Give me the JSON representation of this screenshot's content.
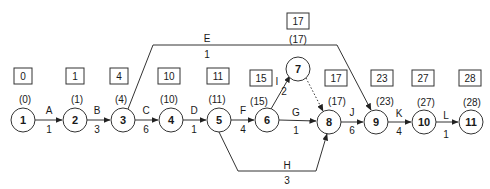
{
  "diagram": {
    "type": "activity-on-arrow network",
    "nodes": [
      {
        "id": "1",
        "x": 23,
        "y": 120,
        "early_start_box": "0",
        "early_start_paren": "(0)"
      },
      {
        "id": "2",
        "x": 75,
        "y": 120,
        "early_start_box": "1",
        "early_start_paren": "(1)"
      },
      {
        "id": "3",
        "x": 123,
        "y": 120,
        "early_start_box": "4",
        "early_start_paren": "(4)"
      },
      {
        "id": "4",
        "x": 171,
        "y": 120,
        "early_start_box": "10",
        "early_start_paren": "(10)"
      },
      {
        "id": "5",
        "x": 219,
        "y": 120,
        "early_start_box": "11",
        "early_start_paren": "(11)"
      },
      {
        "id": "6",
        "x": 267,
        "y": 120,
        "early_start_box": "15",
        "early_start_paren": "(15)"
      },
      {
        "id": "7",
        "x": 298,
        "y": 69,
        "early_start_box": "17",
        "early_start_paren": "(17)"
      },
      {
        "id": "8",
        "x": 329,
        "y": 122,
        "early_start_box": "17",
        "early_start_paren": "(17)"
      },
      {
        "id": "9",
        "x": 376,
        "y": 122,
        "early_start_box": "23",
        "early_start_paren": "(23)"
      },
      {
        "id": "10",
        "x": 424,
        "y": 122,
        "early_start_box": "27",
        "early_start_paren": "(27)"
      },
      {
        "id": "11",
        "x": 471,
        "y": 122,
        "early_start_box": "28",
        "early_start_paren": "(28)"
      }
    ],
    "edges": [
      {
        "activity": "A",
        "duration": "1",
        "from": "1",
        "to": "2"
      },
      {
        "activity": "B",
        "duration": "3",
        "from": "2",
        "to": "3"
      },
      {
        "activity": "C",
        "duration": "6",
        "from": "3",
        "to": "4"
      },
      {
        "activity": "D",
        "duration": "1",
        "from": "4",
        "to": "5"
      },
      {
        "activity": "E",
        "duration": "1",
        "from": "3",
        "to": "9"
      },
      {
        "activity": "F",
        "duration": "4",
        "from": "5",
        "to": "6"
      },
      {
        "activity": "G",
        "duration": "1",
        "from": "6",
        "to": "8"
      },
      {
        "activity": "H",
        "duration": "3",
        "from": "5",
        "to": "8"
      },
      {
        "activity": "I",
        "duration": "2",
        "from": "6",
        "to": "7"
      },
      {
        "activity": "",
        "duration": "",
        "from": "7",
        "to": "8",
        "dummy": true
      },
      {
        "activity": "J",
        "duration": "6",
        "from": "8",
        "to": "9"
      },
      {
        "activity": "K",
        "duration": "4",
        "from": "9",
        "to": "10"
      },
      {
        "activity": "L",
        "duration": "1",
        "from": "10",
        "to": "11"
      }
    ]
  },
  "labels": {
    "n1": "1",
    "n2": "2",
    "n3": "3",
    "n4": "4",
    "n5": "5",
    "n6": "6",
    "n7": "7",
    "n8": "8",
    "n9": "9",
    "n10": "10",
    "n11": "11",
    "b1": "0",
    "b2": "1",
    "b3": "4",
    "b4": "10",
    "b5": "11",
    "b6": "15",
    "b7": "17",
    "b8": "17",
    "b9": "23",
    "b10": "27",
    "b11": "28",
    "p1": "(0)",
    "p2": "(1)",
    "p3": "(4)",
    "p4": "(10)",
    "p5": "(11)",
    "p6": "(15)",
    "p7": "(17)",
    "p8": "(17)",
    "p9": "(23)",
    "p10": "(27)",
    "p11": "(28)",
    "eA": "A",
    "dA": "1",
    "eB": "B",
    "dB": "3",
    "eC": "C",
    "dC": "6",
    "eD": "D",
    "dD": "1",
    "eE": "E",
    "dE": "1",
    "eF": "F",
    "dF": "4",
    "eG": "G",
    "dG": "1",
    "eH": "H",
    "dH": "3",
    "eI": "I",
    "dI": "2",
    "eJ": "J",
    "dJ": "6",
    "eK": "K",
    "dK": "4",
    "eL": "L",
    "dL": "1"
  },
  "colors": {
    "stroke": "#333333",
    "text": "#1a1a1a",
    "background": "#ffffff"
  }
}
